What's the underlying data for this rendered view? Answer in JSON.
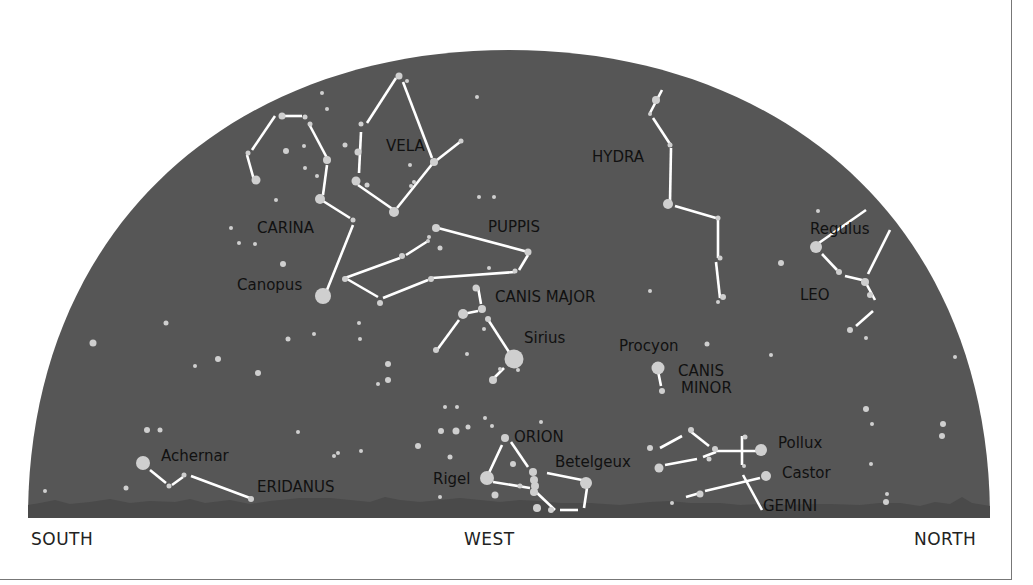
{
  "colors": {
    "sky": "#565656",
    "horizon": "#4a4a4a",
    "star": "#cfcfcf",
    "line": "#ffffff",
    "label": "#111111"
  },
  "directions": {
    "south": "SOUTH",
    "west": "WEST",
    "north": "NORTH"
  },
  "constellations": [
    {
      "name": "CARINA",
      "x": 257,
      "y": 233,
      "size": 15
    },
    {
      "name": "VELA",
      "x": 386,
      "y": 151,
      "size": 15
    },
    {
      "name": "PUPPIS",
      "x": 488,
      "y": 232,
      "size": 15
    },
    {
      "name": "HYDRA",
      "x": 592,
      "y": 162,
      "size": 15
    },
    {
      "name": "CANIS MAJOR",
      "x": 495,
      "y": 302,
      "size": 15
    },
    {
      "name": "LEO",
      "x": 800,
      "y": 300,
      "size": 15
    },
    {
      "name": "CANIS",
      "x": 678,
      "y": 376,
      "size": 15
    },
    {
      "name": "MINOR",
      "x": 681,
      "y": 393,
      "size": 15
    },
    {
      "name": "ORION",
      "x": 514,
      "y": 442,
      "size": 15
    },
    {
      "name": "ERIDANUS",
      "x": 257,
      "y": 492,
      "size": 15
    },
    {
      "name": "GEMINI",
      "x": 763,
      "y": 511,
      "size": 15
    }
  ],
  "named_stars": [
    {
      "name": "Canopus",
      "x": 237,
      "y": 290,
      "size": 15
    },
    {
      "name": "Sirius",
      "x": 524,
      "y": 343,
      "size": 15
    },
    {
      "name": "Procyon",
      "x": 619,
      "y": 351,
      "size": 15
    },
    {
      "name": "Regulus",
      "x": 810,
      "y": 234,
      "size": 15
    },
    {
      "name": "Achernar",
      "x": 161,
      "y": 461,
      "size": 15
    },
    {
      "name": "Rigel",
      "x": 433,
      "y": 484,
      "size": 15
    },
    {
      "name": "Betelgeux",
      "x": 555,
      "y": 467,
      "size": 15
    },
    {
      "name": "Pollux",
      "x": 778,
      "y": 448,
      "size": 15
    },
    {
      "name": "Castor",
      "x": 782,
      "y": 478,
      "size": 15
    }
  ],
  "lines": [
    [
      254,
      180,
      247,
      155
    ],
    [
      252,
      150,
      275,
      116
    ],
    [
      280,
      116,
      302,
      116
    ],
    [
      309,
      124,
      327,
      158
    ],
    [
      327,
      165,
      323,
      195
    ],
    [
      323,
      201,
      350,
      218
    ],
    [
      353,
      225,
      327,
      290
    ],
    [
      367,
      123,
      396,
      78
    ],
    [
      403,
      82,
      432,
      158
    ],
    [
      361,
      132,
      359,
      173
    ],
    [
      358,
      185,
      394,
      210
    ],
    [
      397,
      208,
      433,
      163
    ],
    [
      437,
      160,
      460,
      142
    ],
    [
      345,
      278,
      400,
      258
    ],
    [
      406,
      255,
      428,
      241
    ],
    [
      438,
      228,
      528,
      252
    ],
    [
      528,
      255,
      519,
      270
    ],
    [
      515,
      272,
      432,
      278
    ],
    [
      428,
      280,
      383,
      298
    ],
    [
      378,
      297,
      347,
      279
    ],
    [
      478,
      287,
      481,
      304
    ],
    [
      463,
      314,
      478,
      311
    ],
    [
      459,
      320,
      437,
      350
    ],
    [
      487,
      318,
      509,
      352
    ],
    [
      504,
      368,
      494,
      378
    ],
    [
      662,
      90,
      650,
      113
    ],
    [
      653,
      118,
      670,
      144
    ],
    [
      671,
      148,
      670,
      202
    ],
    [
      675,
      206,
      716,
      218
    ],
    [
      718,
      220,
      718,
      258
    ],
    [
      716,
      262,
      720,
      298
    ],
    [
      816,
      245,
      866,
      210
    ],
    [
      822,
      254,
      837,
      270
    ],
    [
      845,
      276,
      862,
      280
    ],
    [
      868,
      274,
      890,
      230
    ],
    [
      867,
      285,
      875,
      300
    ],
    [
      873,
      311,
      856,
      326
    ],
    [
      658,
      371,
      661,
      386
    ],
    [
      502,
      445,
      488,
      475
    ],
    [
      511,
      442,
      528,
      467
    ],
    [
      493,
      482,
      530,
      488
    ],
    [
      547,
      473,
      582,
      480
    ],
    [
      536,
      492,
      555,
      510
    ],
    [
      587,
      488,
      584,
      508
    ],
    [
      560,
      510,
      578,
      510
    ],
    [
      150,
      470,
      166,
      483
    ],
    [
      172,
      485,
      183,
      477
    ],
    [
      191,
      476,
      250,
      498
    ],
    [
      660,
      448,
      682,
      436
    ],
    [
      690,
      431,
      709,
      446
    ],
    [
      714,
      451,
      758,
      451
    ],
    [
      742,
      436,
      742,
      465
    ],
    [
      665,
      465,
      697,
      459
    ],
    [
      703,
      457,
      716,
      452
    ],
    [
      686,
      497,
      700,
      493
    ],
    [
      705,
      491,
      760,
      478
    ],
    [
      743,
      475,
      762,
      510
    ]
  ],
  "stars": [
    [
      399,
      76,
      3.5
    ],
    [
      407,
      81,
      2
    ],
    [
      322,
      93,
      2
    ],
    [
      327,
      109,
      2
    ],
    [
      477,
      97,
      2
    ],
    [
      282,
      116,
      3.5
    ],
    [
      305,
      117,
      2.5
    ],
    [
      310,
      124,
      2.5
    ],
    [
      248,
      153,
      2.5
    ],
    [
      286,
      151,
      3
    ],
    [
      304,
      146,
      2
    ],
    [
      327,
      160,
      4
    ],
    [
      345,
      145,
      2.5
    ],
    [
      358,
      152,
      3.5
    ],
    [
      361,
      124,
      2.5
    ],
    [
      434,
      162,
      4
    ],
    [
      461,
      141,
      2.5
    ],
    [
      256,
      180,
      4.5
    ],
    [
      305,
      168,
      2
    ],
    [
      317,
      176,
      2
    ],
    [
      356,
      181,
      4.5
    ],
    [
      367,
      185,
      2.5
    ],
    [
      410,
      165,
      2
    ],
    [
      414,
      182,
      2
    ],
    [
      411,
      186,
      2
    ],
    [
      394,
      212,
      5
    ],
    [
      353,
      220,
      2.5
    ],
    [
      320,
      199,
      5
    ],
    [
      276,
      200,
      2
    ],
    [
      479,
      197,
      2
    ],
    [
      494,
      197,
      2
    ],
    [
      231,
      228,
      2
    ],
    [
      239,
      243,
      2
    ],
    [
      255,
      244,
      2
    ],
    [
      283,
      264,
      3
    ],
    [
      436,
      228,
      4
    ],
    [
      429,
      237,
      2
    ],
    [
      428,
      241,
      2
    ],
    [
      440,
      248,
      2.5
    ],
    [
      402,
      256,
      3
    ],
    [
      345,
      279,
      3
    ],
    [
      431,
      279,
      3
    ],
    [
      528,
      252,
      3.5
    ],
    [
      515,
      271,
      2.5
    ],
    [
      489,
      268,
      2
    ],
    [
      323,
      296,
      8
    ],
    [
      380,
      303,
      3
    ],
    [
      476,
      288,
      3.5
    ],
    [
      482,
      309,
      4
    ],
    [
      463,
      314,
      5
    ],
    [
      488,
      319,
      3
    ],
    [
      484,
      329,
      2
    ],
    [
      436,
      350,
      3
    ],
    [
      514,
      359,
      9.5
    ],
    [
      493,
      380,
      4
    ],
    [
      166,
      323,
      2.5
    ],
    [
      93,
      343,
      3.5
    ],
    [
      218,
      359,
      3
    ],
    [
      195,
      366,
      2
    ],
    [
      258,
      373,
      3
    ],
    [
      288,
      339,
      2.5
    ],
    [
      314,
      334,
      2
    ],
    [
      360,
      339,
      2
    ],
    [
      388,
      364,
      3
    ],
    [
      388,
      380,
      3
    ],
    [
      378,
      384,
      2
    ],
    [
      359,
      323,
      2
    ],
    [
      467,
      354,
      2
    ],
    [
      518,
      370,
      2
    ],
    [
      500,
      369,
      2
    ],
    [
      650,
      291,
      2
    ],
    [
      656,
      100,
      4
    ],
    [
      650,
      114,
      2
    ],
    [
      670,
      145,
      2.5
    ],
    [
      668,
      204,
      5
    ],
    [
      718,
      218,
      2.5
    ],
    [
      720,
      258,
      2.5
    ],
    [
      723,
      297,
      3
    ],
    [
      718,
      302,
      2
    ],
    [
      818,
      211,
      2
    ],
    [
      781,
      263,
      3
    ],
    [
      816,
      247,
      6
    ],
    [
      839,
      272,
      3
    ],
    [
      865,
      282,
      4
    ],
    [
      870,
      295,
      3
    ],
    [
      850,
      330,
      3
    ],
    [
      866,
      338,
      2
    ],
    [
      955,
      357,
      2
    ],
    [
      707,
      344,
      2.5
    ],
    [
      771,
      355,
      2
    ],
    [
      658,
      368,
      6.5
    ],
    [
      662,
      391,
      3
    ],
    [
      866,
      409,
      3
    ],
    [
      872,
      424,
      2
    ],
    [
      943,
      424,
      3
    ],
    [
      942,
      436,
      3
    ],
    [
      871,
      464,
      2
    ],
    [
      887,
      494,
      2
    ],
    [
      886,
      502,
      3
    ],
    [
      147,
      430,
      3
    ],
    [
      160,
      430,
      2.5
    ],
    [
      143,
      463,
      7
    ],
    [
      126,
      488,
      2.5
    ],
    [
      45,
      491,
      2
    ],
    [
      169,
      486,
      2.5
    ],
    [
      184,
      475,
      2.5
    ],
    [
      251,
      499,
      3
    ],
    [
      298,
      432,
      2
    ],
    [
      338,
      453,
      2
    ],
    [
      334,
      456,
      2
    ],
    [
      361,
      451,
      2
    ],
    [
      445,
      407,
      2
    ],
    [
      457,
      407,
      2
    ],
    [
      441,
      431,
      3
    ],
    [
      456,
      431,
      3.5
    ],
    [
      468,
      427,
      2.5
    ],
    [
      485,
      418,
      2
    ],
    [
      492,
      426,
      2
    ],
    [
      418,
      446,
      3
    ],
    [
      450,
      457,
      2.5
    ],
    [
      440,
      497,
      2
    ],
    [
      505,
      438,
      4
    ],
    [
      513,
      464,
      3
    ],
    [
      487,
      478,
      7
    ],
    [
      495,
      495,
      3.5
    ],
    [
      520,
      486,
      2.5
    ],
    [
      533,
      472,
      4
    ],
    [
      534,
      480,
      4
    ],
    [
      535,
      486,
      4
    ],
    [
      534,
      492,
      4
    ],
    [
      586,
      483,
      6
    ],
    [
      537,
      508,
      4
    ],
    [
      551,
      510,
      3
    ],
    [
      541,
      422,
      2
    ],
    [
      650,
      448,
      3
    ],
    [
      691,
      430,
      3
    ],
    [
      715,
      449,
      3
    ],
    [
      745,
      437,
      2.5
    ],
    [
      761,
      450,
      6
    ],
    [
      744,
      466,
      2
    ],
    [
      659,
      468,
      4.5
    ],
    [
      709,
      459,
      2.5
    ],
    [
      766,
      476,
      5
    ],
    [
      700,
      494,
      3.5
    ],
    [
      672,
      503,
      2
    ]
  ],
  "horizon": {
    "ground_y": 518,
    "silhouette": "M28,518 L28,505 L40,503 L55,500 L70,504 L90,502 L110,499 L130,503 L150,501 L175,502 L190,499 L205,503 L230,500 L250,504 L270,501 L300,498 L330,498 L350,500 L370,502 L385,497 L400,500 L420,502 L440,500 L460,498 L480,500 L500,502 L520,500 L540,501 L560,503 L590,503 L620,505 L650,502 L670,501 L690,503 L720,503 L740,505 L760,504 L780,505 L810,504 L830,504 L860,505 L880,503 L900,503 L920,506 L935,502 L950,504 L962,497 L972,503 L990,506 L990,518 Z"
  }
}
